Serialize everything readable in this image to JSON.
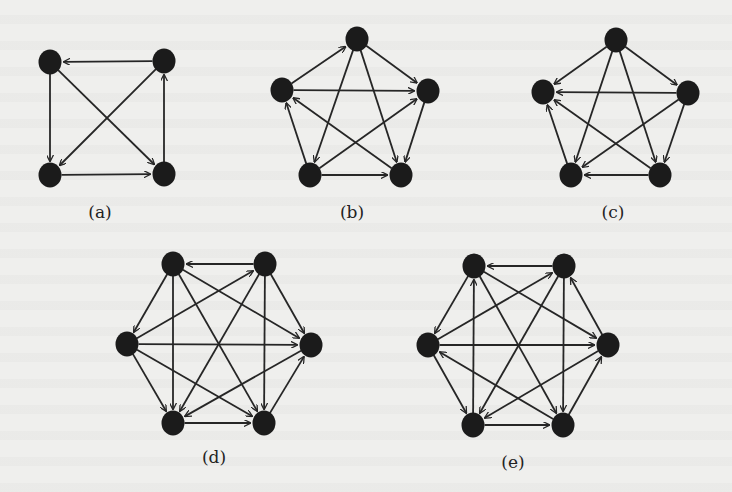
{
  "figure": {
    "background": "#efefed",
    "node_color": "#1b1b1b",
    "edge_color": "#262626",
    "node_rx": 11.5,
    "node_ry": 12.5,
    "edge_width": 1.8
  },
  "subfigures": [
    {
      "id": "a",
      "caption": "(a)",
      "caption_pos": [
        100,
        212
      ],
      "nodes": {
        "TL": [
          50,
          62
        ],
        "TR": [
          164,
          61
        ],
        "BL": [
          50,
          175
        ],
        "BR": [
          164,
          174
        ]
      },
      "edges": [
        [
          "TR",
          "TL"
        ],
        [
          "TL",
          "BL"
        ],
        [
          "TL",
          "BR"
        ],
        [
          "TR",
          "BL"
        ],
        [
          "BL",
          "BR"
        ],
        [
          "BR",
          "TR"
        ]
      ]
    },
    {
      "id": "b",
      "caption": "(b)",
      "caption_pos": [
        352,
        212
      ],
      "nodes": {
        "T": [
          357,
          39
        ],
        "L": [
          282,
          90
        ],
        "R": [
          428,
          91
        ],
        "BL": [
          310,
          175
        ],
        "BR": [
          401,
          175
        ]
      },
      "edges": [
        [
          "L",
          "T"
        ],
        [
          "T",
          "R"
        ],
        [
          "L",
          "R"
        ],
        [
          "T",
          "BL"
        ],
        [
          "T",
          "BR"
        ],
        [
          "BL",
          "L"
        ],
        [
          "BR",
          "L"
        ],
        [
          "BL",
          "R"
        ],
        [
          "R",
          "BR"
        ],
        [
          "BL",
          "BR"
        ]
      ]
    },
    {
      "id": "c",
      "caption": "(c)",
      "caption_pos": [
        613,
        212
      ],
      "nodes": {
        "T": [
          616,
          40
        ],
        "L": [
          543,
          92
        ],
        "R": [
          688,
          93
        ],
        "BL": [
          571,
          175
        ],
        "BR": [
          660,
          175
        ]
      },
      "edges": [
        [
          "T",
          "L"
        ],
        [
          "T",
          "R"
        ],
        [
          "R",
          "L"
        ],
        [
          "T",
          "BL"
        ],
        [
          "T",
          "BR"
        ],
        [
          "BL",
          "L"
        ],
        [
          "BR",
          "L"
        ],
        [
          "R",
          "BL"
        ],
        [
          "R",
          "BR"
        ],
        [
          "BR",
          "BL"
        ]
      ]
    },
    {
      "id": "d",
      "caption": "(d)",
      "caption_pos": [
        214,
        457
      ],
      "nodes": {
        "TL": [
          173,
          264
        ],
        "TR": [
          265,
          264
        ],
        "L": [
          127,
          344
        ],
        "R": [
          311,
          345
        ],
        "BL": [
          173,
          423
        ],
        "BR": [
          264,
          423
        ]
      },
      "edges": [
        [
          "TR",
          "TL"
        ],
        [
          "TL",
          "L"
        ],
        [
          "L",
          "TR"
        ],
        [
          "L",
          "R"
        ],
        [
          "TL",
          "BL"
        ],
        [
          "TL",
          "BR"
        ],
        [
          "TL",
          "R"
        ],
        [
          "TR",
          "BL"
        ],
        [
          "TR",
          "BR"
        ],
        [
          "TR",
          "R"
        ],
        [
          "L",
          "BL"
        ],
        [
          "L",
          "BR"
        ],
        [
          "R",
          "BL"
        ],
        [
          "BR",
          "R"
        ],
        [
          "BL",
          "BR"
        ]
      ]
    },
    {
      "id": "e",
      "caption": "(e)",
      "caption_pos": [
        513,
        462
      ],
      "nodes": {
        "TL": [
          474,
          266
        ],
        "TR": [
          564,
          266
        ],
        "L": [
          428,
          345
        ],
        "R": [
          608,
          345
        ],
        "BL": [
          473,
          425
        ],
        "BR": [
          563,
          425
        ]
      },
      "edges": [
        [
          "TR",
          "TL"
        ],
        [
          "TL",
          "L"
        ],
        [
          "L",
          "TR"
        ],
        [
          "L",
          "R"
        ],
        [
          "BL",
          "TL"
        ],
        [
          "TL",
          "R"
        ],
        [
          "TL",
          "BR"
        ],
        [
          "TR",
          "BL"
        ],
        [
          "TR",
          "BR"
        ],
        [
          "R",
          "TR"
        ],
        [
          "L",
          "BL"
        ],
        [
          "BR",
          "L"
        ],
        [
          "R",
          "BL"
        ],
        [
          "BR",
          "R"
        ],
        [
          "BL",
          "BR"
        ]
      ]
    }
  ]
}
